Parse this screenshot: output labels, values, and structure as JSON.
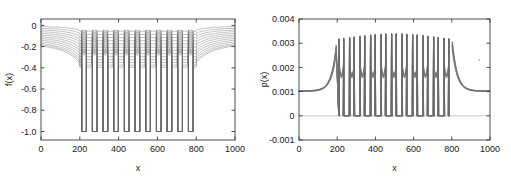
{
  "figure": {
    "background": "#ffffff",
    "curve_color": "#777777",
    "axis_color": "#3a3a3a",
    "width": 511,
    "height": 184
  },
  "chart_data": [
    {
      "type": "line",
      "panel": "left",
      "title": "",
      "xlabel": "x",
      "ylabel": "f(x)",
      "xlim": [
        0,
        1000
      ],
      "ylim": [
        -1.08,
        0.06
      ],
      "xticks": [
        0,
        200,
        400,
        600,
        800,
        1000
      ],
      "xticklabels": [
        "0",
        "200",
        "400",
        "600",
        "800",
        "1000"
      ],
      "yticks": [
        0,
        -0.2,
        -0.4,
        -0.6,
        -0.8,
        -1.0
      ],
      "yticklabels": [
        "0",
        "-0.2",
        "-0.4",
        "-0.6",
        "-0.8",
        "-1.0"
      ],
      "grid": false,
      "legend": null,
      "description": "Family of ~13 nested potential-like curves. Flat plateaus outside x=200..800 fanning between f=0 and f=-0.22; inside the region, 11 deep rectangular wells reaching f=-1.0, with nested rounded arcs stacked between f=-0.05 and f=-0.40 at each well.",
      "series": [
        {
          "name": "level-1",
          "plateau": -0.012,
          "well_depth": -1.0,
          "arc_bottom": -0.055
        },
        {
          "name": "level-2",
          "plateau": -0.03,
          "well_depth": -1.0,
          "arc_bottom": -0.085
        },
        {
          "name": "level-3",
          "plateau": -0.048,
          "well_depth": -1.0,
          "arc_bottom": -0.115
        },
        {
          "name": "level-4",
          "plateau": -0.066,
          "well_depth": -1.0,
          "arc_bottom": -0.145
        },
        {
          "name": "level-5",
          "plateau": -0.084,
          "well_depth": -1.0,
          "arc_bottom": -0.175
        },
        {
          "name": "level-6",
          "plateau": -0.102,
          "well_depth": -1.0,
          "arc_bottom": -0.205
        },
        {
          "name": "level-7",
          "plateau": -0.12,
          "well_depth": -1.0,
          "arc_bottom": -0.235
        },
        {
          "name": "level-8",
          "plateau": -0.138,
          "well_depth": -1.0,
          "arc_bottom": -0.265
        },
        {
          "name": "level-9",
          "plateau": -0.156,
          "well_depth": -1.0,
          "arc_bottom": -0.295
        },
        {
          "name": "level-10",
          "plateau": -0.174,
          "well_depth": -1.0,
          "arc_bottom": -0.325
        },
        {
          "name": "level-11",
          "plateau": -0.192,
          "well_depth": -1.0,
          "arc_bottom": -0.35
        },
        {
          "name": "level-12",
          "plateau": -0.206,
          "well_depth": -1.0,
          "arc_bottom": -0.375
        },
        {
          "name": "level-13",
          "plateau": -0.218,
          "well_depth": -1.0,
          "arc_bottom": -0.395
        }
      ],
      "wells": {
        "count": 11,
        "region_start": 200,
        "region_end": 800,
        "centers": [
          222,
          277,
          332,
          387,
          442,
          497,
          552,
          607,
          662,
          717,
          772
        ],
        "half_width": 12,
        "depth": -1.0
      }
    },
    {
      "type": "line",
      "panel": "right",
      "title": "",
      "xlabel": "x",
      "ylabel": "p(x)",
      "xlim": [
        0,
        1000
      ],
      "ylim": [
        -0.001,
        0.004
      ],
      "xticks": [
        0,
        200,
        400,
        600,
        800,
        1000
      ],
      "xticklabels": [
        "0",
        "200",
        "400",
        "600",
        "800",
        "1000"
      ],
      "yticks": [
        0.004,
        0.003,
        0.002,
        0.001,
        0,
        -0.001
      ],
      "yticklabels": [
        "0.004",
        "0.003",
        "0.002",
        "0.001",
        "0",
        "-0.001"
      ],
      "grid": false,
      "legend": null,
      "description": "Probability density family of ~13 curves. Outside x=200..800 the curves ride a bundled plateau near p=0.00102; approaching x=200 and x=800 they rise steeply. Inside the region there are 22 narrow spikes (pairs at each well edge) reaching p=0.0030 to 0.0034, dropping to p=0 between spikes, with nested U-shaped arcs near p=0.0016-0.0020 inside each well.",
      "baseline": 0.00102,
      "spikes": {
        "count": 22,
        "peak_min": 0.003,
        "peak_max": 0.0034,
        "trough": 0.0,
        "region_start": 200,
        "region_end": 800
      },
      "arcs": {
        "count": 11,
        "top": 0.00205,
        "bottom": 0.00155
      },
      "zero_reference_line": 0
    }
  ],
  "panels": {
    "left": {
      "ylabel": "f(x)",
      "xlabel": "x",
      "xticklabels": [
        "0",
        "200",
        "400",
        "600",
        "800",
        "1000"
      ],
      "yticklabels": [
        "0",
        "-0.2",
        "-0.4",
        "-0.6",
        "-0.8",
        "-1.0"
      ]
    },
    "right": {
      "ylabel": "p(x)",
      "xlabel": "x",
      "xticklabels": [
        "0",
        "200",
        "400",
        "600",
        "800",
        "1000"
      ],
      "yticklabels": [
        "0.004",
        "0.003",
        "0.002",
        "0.001",
        "0",
        "-0.001"
      ]
    }
  }
}
